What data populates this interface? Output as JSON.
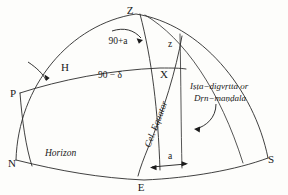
{
  "figure": {
    "type": "celestial-sphere-diagram",
    "background_color": "#fdfdfb",
    "line_color": "#2b2b2b"
  },
  "points": {
    "zenith": "Z",
    "pole": "P",
    "north": "N",
    "south": "S",
    "east": "E",
    "star": "X",
    "hour_circle_point": "H"
  },
  "angles": {
    "zenith_distance": "z",
    "azimuth_complement": "90+a",
    "polar_distance": "90 − δ",
    "amplitude": "a"
  },
  "curves": {
    "horizon": "Horizon",
    "equator": "Cel. Equator"
  },
  "annotations": {
    "vertical_circle_line1": "Iṣṭa−digvṛtta or",
    "vertical_circle_line2": "Dṛn−maṇḍala"
  },
  "icons": {
    "arrow_to_h": "arrow-icon",
    "arrow_to_zenith_angle": "arrow-icon",
    "arrow_to_vertical_circle": "curved-arrow-icon",
    "amplitude_arrow_left": "arrow-left-icon",
    "amplitude_arrow_right": "arrow-right-icon"
  }
}
